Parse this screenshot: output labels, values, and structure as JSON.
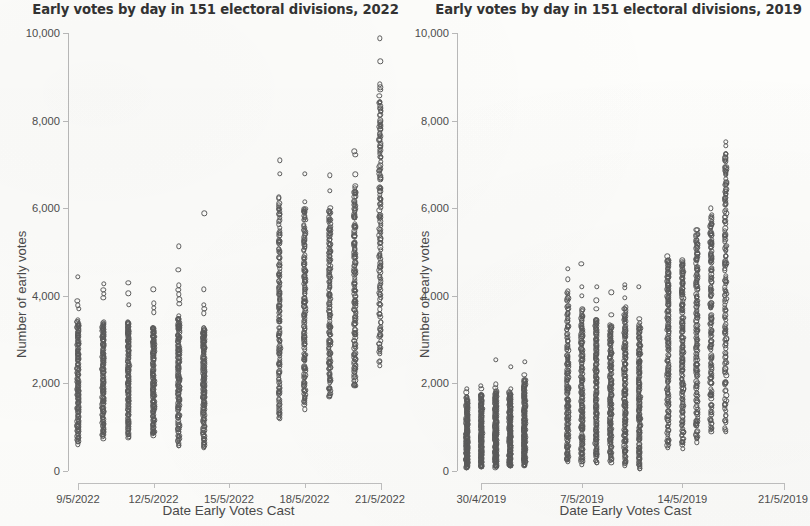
{
  "figure": {
    "background_color": "#fdfdfb",
    "marker_color": "#5c5c5c",
    "axis_color": "#b9b9b9"
  },
  "panels": [
    {
      "id": "left",
      "title": "Early votes by day in 151 electoral divisions, 2022",
      "xlabel": "Date Early Votes Cast",
      "ylabel": "Number of early votes",
      "ytick_labels": [
        "0",
        "2,000",
        "4,000",
        "6,000",
        "8,000",
        "10,000"
      ],
      "xtick_labels": [
        "9/5/2022",
        "12/5/2022",
        "15/5/2022",
        "18/5/2022",
        "21/5/2022"
      ]
    },
    {
      "id": "right",
      "title": "Early votes by day in 151 electoral divisions, 2019",
      "xlabel": "Date Early Votes Cast",
      "ylabel": "Number of early votes",
      "ytick_labels": [
        "0",
        "2,000",
        "4,000",
        "6,000",
        "8,000",
        "10,000"
      ],
      "xtick_labels": [
        "30/4/2019",
        "7/5/2019",
        "14/5/2019",
        "21/5/2019"
      ]
    }
  ],
  "chart_data": [
    {
      "type": "scatter",
      "panel": "left",
      "title": "Early votes by day in 151 electoral divisions, 2022",
      "xlabel": "Date Early Votes Cast",
      "ylabel": "Number of early votes",
      "ylim": [
        0,
        10000
      ],
      "yticks": [
        0,
        2000,
        4000,
        6000,
        8000,
        10000
      ],
      "xticks": [
        "9/5/2022",
        "12/5/2022",
        "15/5/2022",
        "18/5/2022",
        "21/5/2022"
      ],
      "xlim": [
        "9/5/2022",
        "21/5/2022"
      ],
      "grid": false,
      "legend": "none",
      "n_divisions": 151,
      "note": "One open circle per electoral division per day (151 per column); vertical strips show the spread of early vote counts each day.",
      "columns": [
        {
          "date": "9/5/2022",
          "x_offset_days": 0,
          "n": 151,
          "min": 620,
          "q1": 1450,
          "median": 2050,
          "q3": 2750,
          "max": 4430,
          "dense_top": 3450,
          "outliers": [
            3700,
            3780,
            3880,
            4430
          ]
        },
        {
          "date": "10/5/2022",
          "x_offset_days": 1,
          "n": 151,
          "min": 760,
          "q1": 1500,
          "median": 2150,
          "q3": 2850,
          "max": 4280,
          "dense_top": 3400,
          "outliers": [
            3950,
            4040,
            4130,
            4280
          ]
        },
        {
          "date": "11/5/2022",
          "x_offset_days": 2,
          "n": 151,
          "min": 760,
          "q1": 1550,
          "median": 2200,
          "q3": 2900,
          "max": 4300,
          "dense_top": 3400,
          "outliers": [
            3800,
            4060,
            4300
          ]
        },
        {
          "date": "12/5/2022",
          "x_offset_days": 3,
          "n": 151,
          "min": 800,
          "q1": 1500,
          "median": 2150,
          "q3": 2850,
          "max": 4150,
          "dense_top": 3300,
          "outliers": [
            3620,
            3720,
            3830,
            4150
          ]
        },
        {
          "date": "13/5/2022",
          "x_offset_days": 4,
          "n": 151,
          "min": 560,
          "q1": 1550,
          "median": 2250,
          "q3": 2950,
          "max": 5130,
          "dense_top": 3500,
          "outliers": [
            3820,
            3920,
            4030,
            4140,
            4240,
            4600,
            5130
          ]
        },
        {
          "date": "14/5/2022",
          "x_offset_days": 5,
          "n": 151,
          "min": 530,
          "q1": 1450,
          "median": 2100,
          "q3": 2800,
          "max": 5880,
          "dense_top": 3250,
          "outliers": [
            3600,
            3700,
            3800,
            4150,
            5880
          ]
        },
        {
          "date": "17/5/2022",
          "x_offset_days": 8,
          "n": 151,
          "min": 1160,
          "q1": 2450,
          "median": 3600,
          "q3": 4700,
          "max": 7090,
          "dense_top": 6280,
          "outliers": [
            6780,
            7090
          ]
        },
        {
          "date": "18/5/2022",
          "x_offset_days": 9,
          "n": 151,
          "min": 1450,
          "q1": 2600,
          "median": 3700,
          "q3": 4800,
          "max": 6790,
          "dense_top": 6100,
          "outliers": [
            6790
          ]
        },
        {
          "date": "19/5/2022",
          "x_offset_days": 10,
          "n": 151,
          "min": 1640,
          "q1": 2700,
          "median": 3800,
          "q3": 4950,
          "max": 6750,
          "dense_top": 5980,
          "outliers": [
            6400,
            6750
          ]
        },
        {
          "date": "20/5/2022",
          "x_offset_days": 11,
          "n": 151,
          "min": 1900,
          "q1": 3100,
          "median": 4250,
          "q3": 5400,
          "max": 7300,
          "dense_top": 6520,
          "outliers": [
            6770,
            7220,
            7300
          ]
        },
        {
          "date": "21/5/2022",
          "x_offset_days": 12,
          "n": 151,
          "min": 2430,
          "q1": 4150,
          "median": 5700,
          "q3": 7200,
          "max": 9880,
          "dense_top": 8500,
          "outliers": [
            8700,
            8760,
            8830,
            9350,
            9880
          ]
        }
      ]
    },
    {
      "type": "scatter",
      "panel": "right",
      "title": "Early votes by day in 151 electoral divisions, 2019",
      "xlabel": "Date Early Votes Cast",
      "ylabel": "Number of early votes",
      "ylim": [
        0,
        10000
      ],
      "yticks": [
        0,
        2000,
        4000,
        6000,
        8000,
        10000
      ],
      "xticks": [
        "30/4/2019",
        "7/5/2019",
        "14/5/2019",
        "21/5/2019"
      ],
      "xlim": [
        "29/4/2019",
        "21/5/2019"
      ],
      "grid": false,
      "legend": "none",
      "n_divisions": 151,
      "note": "One open circle per electoral division per day (151 per column); vertical strips show the spread of early vote counts each day.",
      "columns": [
        {
          "date": "29/4/2019",
          "x_offset_days": 0,
          "n": 151,
          "min": 70,
          "q1": 420,
          "median": 760,
          "q3": 1200,
          "max": 1880,
          "dense_top": 1700,
          "outliers": [
            1800,
            1880
          ]
        },
        {
          "date": "30/4/2019",
          "x_offset_days": 1,
          "n": 151,
          "min": 80,
          "q1": 450,
          "median": 800,
          "q3": 1260,
          "max": 1950,
          "dense_top": 1760,
          "outliers": [
            1870,
            1950
          ]
        },
        {
          "date": "1/5/2019",
          "x_offset_days": 2,
          "n": 151,
          "min": 90,
          "q1": 480,
          "median": 860,
          "q3": 1340,
          "max": 2540,
          "dense_top": 1820,
          "outliers": [
            1900,
            1980,
            2540
          ]
        },
        {
          "date": "2/5/2019",
          "x_offset_days": 3,
          "n": 151,
          "min": 90,
          "q1": 470,
          "median": 850,
          "q3": 1320,
          "max": 2380,
          "dense_top": 1790,
          "outliers": [
            1880,
            2380
          ]
        },
        {
          "date": "3/5/2019",
          "x_offset_days": 4,
          "n": 151,
          "min": 110,
          "q1": 520,
          "median": 960,
          "q3": 1500,
          "max": 2490,
          "dense_top": 2080,
          "outliers": [
            2200,
            2490
          ]
        },
        {
          "date": "6/5/2019",
          "x_offset_days": 7,
          "n": 151,
          "min": 200,
          "q1": 1000,
          "median": 1800,
          "q3": 2750,
          "max": 4620,
          "dense_top": 4100,
          "outliers": [
            4380,
            4620
          ]
        },
        {
          "date": "7/5/2019",
          "x_offset_days": 8,
          "n": 151,
          "min": 190,
          "q1": 1000,
          "median": 1800,
          "q3": 2700,
          "max": 4730,
          "dense_top": 3700,
          "outliers": [
            4000,
            4200,
            4730
          ]
        },
        {
          "date": "8/5/2019",
          "x_offset_days": 9,
          "n": 151,
          "min": 180,
          "q1": 1000,
          "median": 1780,
          "q3": 2650,
          "max": 4210,
          "dense_top": 3500,
          "outliers": [
            3700,
            3900,
            4210
          ]
        },
        {
          "date": "9/5/2019",
          "x_offset_days": 10,
          "n": 151,
          "min": 230,
          "q1": 1000,
          "median": 1750,
          "q3": 2600,
          "max": 4080,
          "dense_top": 3350,
          "outliers": [
            3560,
            4080
          ]
        },
        {
          "date": "10/5/2019",
          "x_offset_days": 11,
          "n": 151,
          "min": 150,
          "q1": 1000,
          "median": 1800,
          "q3": 2750,
          "max": 4250,
          "dense_top": 3750,
          "outliers": [
            3950,
            4180,
            4250
          ]
        },
        {
          "date": "11/5/2019",
          "x_offset_days": 12,
          "n": 151,
          "min": 30,
          "q1": 900,
          "median": 1650,
          "q3": 2500,
          "max": 4200,
          "dense_top": 3350,
          "outliers": [
            3480,
            4200
          ]
        },
        {
          "date": "13/5/2019",
          "x_offset_days": 14,
          "n": 151,
          "min": 500,
          "q1": 1800,
          "median": 2950,
          "q3": 4000,
          "max": 4900,
          "dense_top": 4880,
          "outliers": []
        },
        {
          "date": "14/5/2019",
          "x_offset_days": 15,
          "n": 151,
          "min": 510,
          "q1": 1800,
          "median": 2900,
          "q3": 3950,
          "max": 4830,
          "dense_top": 4820,
          "outliers": []
        },
        {
          "date": "15/5/2019",
          "x_offset_days": 16,
          "n": 151,
          "min": 640,
          "q1": 2050,
          "median": 3250,
          "q3": 4450,
          "max": 5500,
          "dense_top": 5500,
          "outliers": []
        },
        {
          "date": "16/5/2019",
          "x_offset_days": 17,
          "n": 151,
          "min": 840,
          "q1": 2300,
          "median": 3600,
          "q3": 4900,
          "max": 6000,
          "dense_top": 5800,
          "outliers": [
            6000
          ]
        },
        {
          "date": "17/5/2019",
          "x_offset_days": 18,
          "n": 151,
          "min": 950,
          "q1": 2900,
          "median": 4400,
          "q3": 6000,
          "max": 7520,
          "dense_top": 7280,
          "outliers": [
            7420,
            7520
          ]
        }
      ]
    }
  ]
}
